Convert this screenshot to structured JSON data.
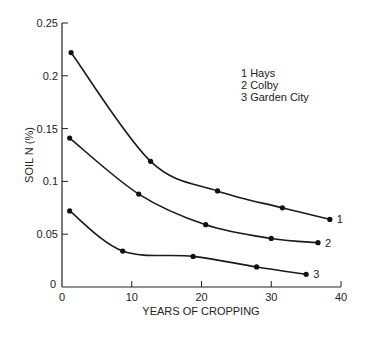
{
  "chart_data": {
    "type": "line",
    "title": "",
    "xlabel": "YEARS OF CROPPING",
    "ylabel": "SOIL N (%)",
    "xlim": [
      0,
      40
    ],
    "ylim": [
      0,
      0.25
    ],
    "x_ticks": [
      "0",
      "10",
      "20",
      "30",
      "40"
    ],
    "y_ticks": [
      "0",
      "0.05",
      "0.1",
      "0.15",
      "0.2",
      "0.25"
    ],
    "grid": false,
    "legend_position": "upper right (text block)",
    "legend": [
      "1 Hays",
      "2 Colby",
      "3 Garden City"
    ],
    "series": [
      {
        "name": "Hays",
        "label": "1",
        "points": [
          [
            1.3,
            0.222
          ],
          [
            12.7,
            0.119
          ],
          [
            22.3,
            0.091
          ],
          [
            31.6,
            0.075
          ],
          [
            38.4,
            0.064
          ]
        ]
      },
      {
        "name": "Colby",
        "label": "2",
        "points": [
          [
            1.1,
            0.141
          ],
          [
            11.0,
            0.088
          ],
          [
            20.6,
            0.059
          ],
          [
            30.0,
            0.046
          ],
          [
            36.7,
            0.042
          ]
        ]
      },
      {
        "name": "Garden City",
        "label": "3",
        "points": [
          [
            1.1,
            0.072
          ],
          [
            8.7,
            0.034
          ],
          [
            18.8,
            0.029
          ],
          [
            27.9,
            0.019
          ],
          [
            35.0,
            0.012
          ]
        ]
      }
    ]
  }
}
